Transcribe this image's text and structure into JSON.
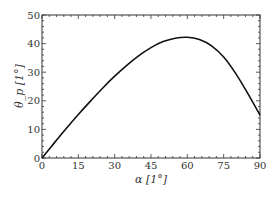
{
  "chart_data": {
    "type": "line",
    "title": "",
    "xlabel": "α [1°]",
    "ylabel": "θ_p [1°]",
    "xlim": [
      0,
      90
    ],
    "ylim": [
      0,
      50
    ],
    "xticks": [
      0,
      15,
      30,
      45,
      60,
      75,
      90
    ],
    "yticks": [
      0,
      10,
      20,
      30,
      40,
      50
    ],
    "grid": false,
    "legend": null,
    "series": [
      {
        "name": "theta_p",
        "color": "#111111",
        "x": [
          0,
          5,
          10,
          15,
          20,
          25,
          30,
          35,
          40,
          45,
          50,
          55,
          60,
          65,
          70,
          75,
          80,
          85,
          90
        ],
        "y": [
          0,
          5.2,
          10.3,
          15.2,
          19.9,
          24.4,
          28.6,
          32.4,
          35.8,
          38.6,
          40.7,
          41.9,
          42.2,
          41.4,
          39.2,
          35.3,
          29.5,
          22.5,
          15.0
        ]
      }
    ]
  }
}
